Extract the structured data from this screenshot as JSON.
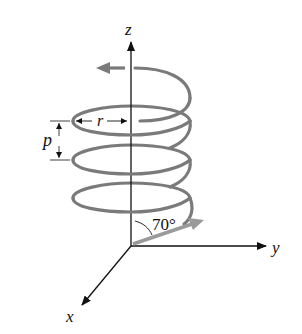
{
  "figure": {
    "type": "helix-trajectory-diagram",
    "axes": {
      "z_label": "z",
      "y_label": "y",
      "x_label": "x"
    },
    "annotations": {
      "radius_label": "r",
      "pitch_label": "p",
      "angle_label": "70°"
    },
    "colors": {
      "axis": "#111111",
      "helix": "#7a7a7a",
      "velocity_arrow": "#9a9a9a",
      "background": "#ffffff"
    }
  }
}
